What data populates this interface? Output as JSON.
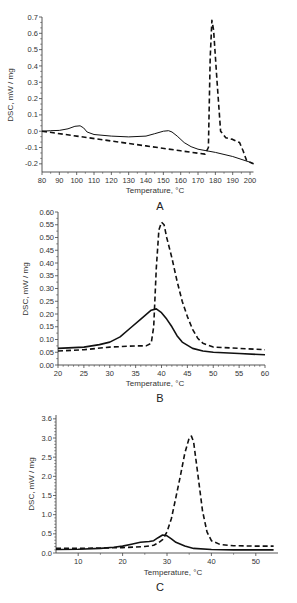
{
  "chart_data": [
    {
      "panel": "A",
      "type": "line",
      "xlabel": "Temperature, °C",
      "ylabel": "DSC, mW / mg",
      "xlim": [
        80,
        202
      ],
      "ylim": [
        -0.25,
        0.7
      ],
      "xticks": [
        80,
        90,
        100,
        110,
        120,
        130,
        140,
        150,
        160,
        170,
        180,
        190,
        200
      ],
      "yticks": [
        -0.2,
        -0.1,
        0.0,
        0.1,
        0.2,
        0.3,
        0.4,
        0.5,
        0.6,
        0.7
      ],
      "ytick_labels": [
        "-0.2",
        "-0.1",
        "0.0",
        "0.1",
        "0.2",
        "0.3",
        "0.4",
        "0.5",
        "0.6",
        "0.7"
      ],
      "grid": false,
      "legend": null,
      "series": [
        {
          "name": "solid",
          "style": "solid",
          "x": [
            80,
            85,
            90,
            95,
            99,
            102,
            104,
            106,
            110,
            120,
            130,
            140,
            145,
            150,
            153,
            155,
            158,
            162,
            166,
            170,
            180,
            190,
            200,
            202
          ],
          "y": [
            0.0,
            0.003,
            0.005,
            0.015,
            0.03,
            0.033,
            0.02,
            -0.005,
            -0.02,
            -0.03,
            -0.035,
            -0.03,
            -0.015,
            0.0,
            0.003,
            -0.005,
            -0.03,
            -0.07,
            -0.095,
            -0.11,
            -0.13,
            -0.155,
            -0.19,
            -0.2
          ]
        },
        {
          "name": "dashed",
          "style": "dashed",
          "x": [
            80,
            100,
            120,
            140,
            160,
            170,
            174,
            176,
            177,
            178,
            179,
            181,
            183,
            186,
            190,
            194,
            196,
            198,
            200,
            202
          ],
          "y": [
            0.0,
            -0.03,
            -0.06,
            -0.09,
            -0.12,
            -0.135,
            -0.14,
            -0.1,
            0.45,
            0.68,
            0.62,
            0.3,
            0.0,
            -0.04,
            -0.05,
            -0.07,
            -0.12,
            -0.18,
            -0.19,
            -0.2
          ]
        }
      ]
    },
    {
      "panel": "B",
      "type": "line",
      "xlabel": "Temperature, °C",
      "ylabel": "DSC, mW / mg",
      "xlim": [
        20,
        60
      ],
      "ylim": [
        0.0,
        0.6
      ],
      "xticks": [
        20,
        25,
        30,
        35,
        40,
        45,
        50,
        55,
        60
      ],
      "yticks": [
        0.0,
        0.05,
        0.1,
        0.15,
        0.2,
        0.25,
        0.3,
        0.35,
        0.4,
        0.45,
        0.5,
        0.55,
        0.6
      ],
      "ytick_labels": [
        "0.00",
        "0.05",
        "0.10",
        "0.15",
        "0.20",
        "0.25",
        "0.30",
        "0.35",
        "0.40",
        "0.45",
        "0.50",
        "0.55",
        "0.60"
      ],
      "grid": false,
      "legend": null,
      "series": [
        {
          "name": "solid",
          "style": "solid",
          "x": [
            20,
            25,
            28,
            30,
            32,
            34,
            36,
            38,
            39,
            40,
            41,
            42,
            43,
            44,
            46,
            48,
            50,
            55,
            60
          ],
          "y": [
            0.065,
            0.07,
            0.08,
            0.09,
            0.11,
            0.145,
            0.18,
            0.215,
            0.22,
            0.205,
            0.18,
            0.15,
            0.115,
            0.09,
            0.065,
            0.055,
            0.05,
            0.045,
            0.04
          ]
        },
        {
          "name": "dashed",
          "style": "dashed",
          "x": [
            20,
            25,
            30,
            35,
            37,
            38,
            38.5,
            39,
            39.5,
            40,
            40.5,
            41,
            42,
            43,
            44,
            45,
            46,
            47,
            48,
            50,
            55,
            60
          ],
          "y": [
            0.055,
            0.06,
            0.07,
            0.075,
            0.075,
            0.085,
            0.15,
            0.38,
            0.53,
            0.56,
            0.55,
            0.5,
            0.42,
            0.33,
            0.25,
            0.19,
            0.14,
            0.105,
            0.085,
            0.07,
            0.065,
            0.06
          ]
        }
      ]
    },
    {
      "panel": "C",
      "type": "line",
      "xlabel": "Temperature, °C",
      "ylabel": "DSC, mW / mg",
      "xlim": [
        5,
        55
      ],
      "ylim": [
        0.0,
        3.6
      ],
      "xticks": [
        10,
        20,
        30,
        40,
        50
      ],
      "yticks": [
        0.0,
        0.5,
        1.0,
        1.5,
        2.0,
        2.5,
        3.0,
        3.5
      ],
      "ytick_labels": [
        "0.0",
        "0.5",
        "1.0",
        "1.5",
        "2.0",
        "2.5",
        "3.0",
        "3.6"
      ],
      "grid": false,
      "legend": null,
      "series": [
        {
          "name": "solid",
          "style": "solid",
          "x": [
            5,
            10,
            15,
            18,
            20,
            22,
            24,
            26,
            27,
            28,
            29,
            30,
            31,
            32,
            34,
            36,
            40,
            45,
            50,
            54
          ],
          "y": [
            0.09,
            0.1,
            0.12,
            0.15,
            0.18,
            0.23,
            0.28,
            0.3,
            0.32,
            0.4,
            0.47,
            0.45,
            0.37,
            0.28,
            0.18,
            0.12,
            0.09,
            0.08,
            0.08,
            0.08
          ]
        },
        {
          "name": "dashed",
          "style": "dashed",
          "x": [
            5,
            10,
            15,
            20,
            25,
            27,
            28,
            29,
            30,
            31,
            32,
            33,
            34,
            35,
            35.5,
            36,
            37,
            38,
            39,
            40,
            42,
            45,
            50,
            54
          ],
          "y": [
            0.12,
            0.12,
            0.13,
            0.14,
            0.17,
            0.2,
            0.26,
            0.35,
            0.55,
            0.9,
            1.45,
            2.0,
            2.6,
            3.0,
            3.05,
            2.9,
            2.0,
            1.1,
            0.55,
            0.32,
            0.22,
            0.19,
            0.18,
            0.18
          ]
        }
      ]
    }
  ],
  "panels": {
    "a": {
      "label": "A",
      "xlabel": "Temperature, °C",
      "ylabel": "DSC, mW / mg"
    },
    "b": {
      "label": "B",
      "xlabel": "Temperature, °C",
      "ylabel": "DSC, mW / mg"
    },
    "c": {
      "label": "C",
      "xlabel": "Temperature, °C",
      "ylabel": "DSC, mW / mg"
    }
  }
}
